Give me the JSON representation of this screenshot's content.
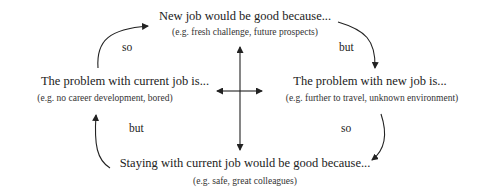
{
  "nodes": {
    "top": {
      "title": "New job would be good because...",
      "example": "(e.g. fresh challenge, future prospects)"
    },
    "left": {
      "title": "The problem with current job is...",
      "example": "(e.g. no career development, bored)"
    },
    "right": {
      "title": "The problem with new job is...",
      "example": "(e.g. further to travel, unknown environment)"
    },
    "bottom": {
      "title": "Staying with current job would be good because...",
      "example": "(e.g. safe, great colleagues)"
    }
  },
  "connectors": {
    "top_left": "so",
    "top_right": "but",
    "bottom_left": "but",
    "bottom_right": "so"
  },
  "colors": {
    "line": "#222222",
    "text": "#222222"
  }
}
